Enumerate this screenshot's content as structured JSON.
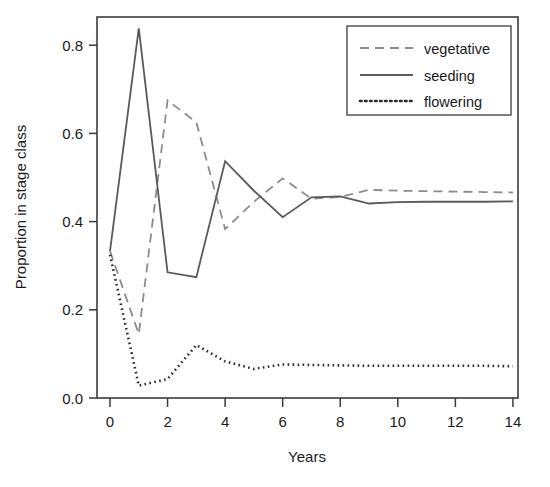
{
  "chart_data": {
    "type": "line",
    "title": "",
    "xlabel": "Years",
    "ylabel": "Proportion in stage class",
    "xlim": [
      -0.25,
      14.4
    ],
    "ylim": [
      0.0,
      0.86
    ],
    "xticks": [
      0,
      2,
      4,
      6,
      8,
      10,
      12,
      14
    ],
    "xtick_labels": [
      "0",
      "2",
      "4",
      "6",
      "8",
      "10",
      "12",
      "14"
    ],
    "yticks": [
      0.0,
      0.2,
      0.4,
      0.6,
      0.8
    ],
    "ytick_labels": [
      "0.0",
      "0.2",
      "0.4",
      "0.6",
      "0.8"
    ],
    "grid": false,
    "legend_position": "top-right",
    "x": [
      0,
      1,
      2,
      3,
      4,
      5,
      6,
      7,
      8,
      9,
      10,
      11,
      12,
      13,
      14
    ],
    "series": [
      {
        "name": "vegetative",
        "style": "dashed",
        "color": "#8c8c8c",
        "values": [
          0.333,
          0.145,
          0.675,
          0.625,
          0.383,
          0.445,
          0.498,
          0.452,
          0.456,
          0.472,
          0.47,
          0.469,
          0.468,
          0.467,
          0.466
        ]
      },
      {
        "name": "seeding",
        "style": "solid",
        "color": "#5a5a5a",
        "values": [
          0.333,
          0.838,
          0.285,
          0.274,
          0.537,
          0.47,
          0.41,
          0.455,
          0.457,
          0.441,
          0.444,
          0.445,
          0.445,
          0.445,
          0.446
        ]
      },
      {
        "name": "flowering",
        "style": "dotted",
        "color": "#2b2b2b",
        "values": [
          0.325,
          0.028,
          0.043,
          0.12,
          0.083,
          0.066,
          0.076,
          0.075,
          0.074,
          0.073,
          0.073,
          0.073,
          0.073,
          0.073,
          0.072
        ]
      }
    ]
  },
  "legend": {
    "entries": [
      {
        "label": "vegetative"
      },
      {
        "label": "seeding"
      },
      {
        "label": "flowering"
      }
    ]
  }
}
